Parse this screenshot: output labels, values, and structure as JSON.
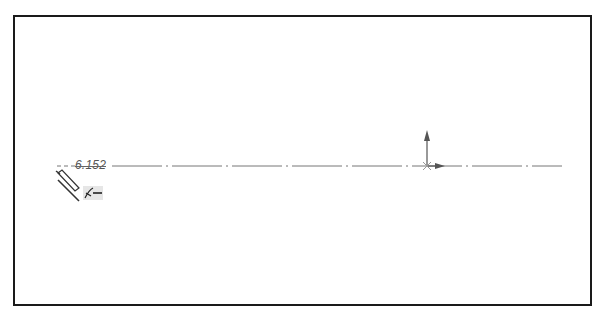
{
  "sketch": {
    "dimension_value": "6.152",
    "centerline": {
      "x1": 57,
      "x2": 562,
      "y": 166,
      "color": "#777777"
    },
    "origin": {
      "x": 427,
      "y": 166,
      "color": "#555555"
    },
    "frame_color": "#1a1a1a",
    "cursor_icons": [
      "pencil-icon",
      "line-icon",
      "tangent-relation-icon"
    ]
  }
}
